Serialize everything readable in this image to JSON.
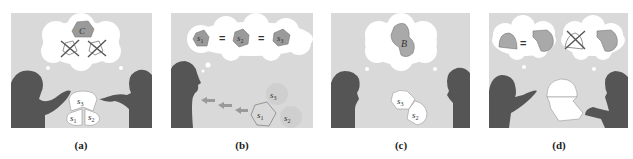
{
  "figure": {
    "panels": [
      {
        "id": "a",
        "caption": "(a)",
        "thought": {
          "main_label": "C",
          "rejected_shapes": 2
        },
        "pieces": [
          {
            "label": "s",
            "sub": "3"
          },
          {
            "label": "s",
            "sub": "1"
          },
          {
            "label": "s",
            "sub": "2"
          }
        ]
      },
      {
        "id": "b",
        "caption": "(b)",
        "thought": {
          "items": [
            {
              "label": "s",
              "sub": "1"
            },
            {
              "label": "s",
              "sub": "2"
            },
            {
              "label": "s",
              "sub": "3"
            }
          ],
          "operator": "="
        },
        "pieces": [
          {
            "label": "s",
            "sub": "3"
          },
          {
            "label": "s",
            "sub": "1"
          },
          {
            "label": "s",
            "sub": "2"
          }
        ]
      },
      {
        "id": "c",
        "caption": "(c)",
        "thought": {
          "main_label": "B"
        },
        "pieces": [
          {
            "label": "s",
            "sub": "3"
          },
          {
            "label": "s",
            "sub": "2"
          }
        ]
      },
      {
        "id": "d",
        "caption": "(d)",
        "thought": {
          "left_operator": "=",
          "right_rejected": true
        }
      }
    ],
    "colors": {
      "panel_bg": "#d9d9d9",
      "silhouette": "#555555",
      "bubble": "#ffffff",
      "shape_fill": "#a9a9a9",
      "piece_fill": "#ffffff",
      "faded_piece": "#cfcfcf",
      "arrow": "#9a9a9a"
    }
  }
}
